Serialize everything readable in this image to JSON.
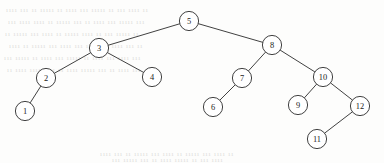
{
  "diagram": {
    "type": "binary-search-tree",
    "canvas": {
      "width": 384,
      "height": 163
    },
    "style": {
      "background_color": "#fdfdfc",
      "stroke_color": "#2b2b2b",
      "node_fill_color": "#ffffff",
      "label_color": "#1b1b1b",
      "node_radius": 9.6,
      "edge_width": 0.9
    },
    "nodes": [
      {
        "id": "n5",
        "label": "5",
        "x": 189,
        "y": 21,
        "r": 9.6,
        "level": 0
      },
      {
        "id": "n3",
        "label": "3",
        "x": 99,
        "y": 48,
        "r": 9.6,
        "level": 1
      },
      {
        "id": "n8",
        "label": "8",
        "x": 272,
        "y": 45,
        "r": 9.6,
        "level": 1
      },
      {
        "id": "n2",
        "label": "2",
        "x": 46,
        "y": 78,
        "r": 9.6,
        "level": 2
      },
      {
        "id": "n4",
        "label": "4",
        "x": 152,
        "y": 77,
        "r": 9.6,
        "level": 2
      },
      {
        "id": "n7",
        "label": "7",
        "x": 242,
        "y": 78,
        "r": 9.6,
        "level": 2
      },
      {
        "id": "n10",
        "label": "10",
        "x": 323,
        "y": 77,
        "r": 9.6,
        "level": 2
      },
      {
        "id": "n1",
        "label": "1",
        "x": 25,
        "y": 111,
        "r": 9.6,
        "level": 3
      },
      {
        "id": "n6",
        "label": "6",
        "x": 213,
        "y": 107,
        "r": 9.6,
        "level": 3
      },
      {
        "id": "n9",
        "label": "9",
        "x": 298,
        "y": 105,
        "r": 9.6,
        "level": 3
      },
      {
        "id": "n12",
        "label": "12",
        "x": 360,
        "y": 106,
        "r": 9.6,
        "level": 3
      },
      {
        "id": "n11",
        "label": "11",
        "x": 317,
        "y": 139,
        "r": 9.6,
        "level": 4
      }
    ],
    "edges": [
      {
        "id": "e5-3",
        "from": "n5",
        "to": "n3",
        "side": "left"
      },
      {
        "id": "e5-8",
        "from": "n5",
        "to": "n8",
        "side": "right"
      },
      {
        "id": "e3-2",
        "from": "n3",
        "to": "n2",
        "side": "left"
      },
      {
        "id": "e3-4",
        "from": "n3",
        "to": "n4",
        "side": "right"
      },
      {
        "id": "e2-1",
        "from": "n2",
        "to": "n1",
        "side": "left"
      },
      {
        "id": "e8-7",
        "from": "n8",
        "to": "n7",
        "side": "left"
      },
      {
        "id": "e8-10",
        "from": "n8",
        "to": "n10",
        "side": "right"
      },
      {
        "id": "e7-6",
        "from": "n7",
        "to": "n6",
        "side": "left"
      },
      {
        "id": "e10-9",
        "from": "n10",
        "to": "n9",
        "side": "left"
      },
      {
        "id": "e10-12",
        "from": "n10",
        "to": "n12",
        "side": "right"
      },
      {
        "id": "e12-11",
        "from": "n12",
        "to": "n11",
        "side": "left"
      }
    ]
  },
  "background_artifacts": [
    {
      "text": "ıııı ııı ıı ııııı ıı ıııı ııı ııııı ıı ııı ıııı ıı",
      "x": 6,
      "y": 6
    },
    {
      "text": "ııı ıııı ıııı ıı ııııı ııı ıı ıııı ııı ııııı ııı",
      "x": 8,
      "y": 18
    },
    {
      "text": "ıı ııııı ııı ıııı ıı ııııı ıııı ıı ııı ııııı ıı",
      "x": 5,
      "y": 30
    },
    {
      "text": "ıııı ıı ııııı ııı ıııı ııı ıı ııııı ıııı ııı ıı",
      "x": 9,
      "y": 42
    },
    {
      "text": "ııı ııııı ıı ıııı ııı ııııı ıı ıııı ııı ıııı ııı",
      "x": 4,
      "y": 54
    },
    {
      "text": "ıı ıııı ııııı ııı ıı ıııı ııııı ııı ıı ıııı ııı",
      "x": 7,
      "y": 66
    },
    {
      "text": "ıııı ııı ıı ııııı ııı ıııı ıı ııııı ııı ıııı ıı",
      "x": 100,
      "y": 150
    },
    {
      "text": "ııı ııııı ııı ıı ıııı ııııı ıı ııı ıııı",
      "x": 112,
      "y": 156
    }
  ]
}
